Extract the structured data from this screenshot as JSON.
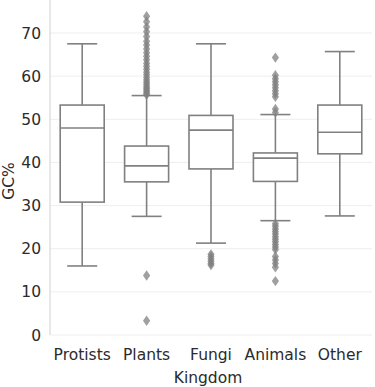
{
  "chart_data": {
    "type": "box",
    "title": "",
    "subtitle": "",
    "xlabel": "Kingdom",
    "ylabel": "GC%",
    "categories": [
      "Protists",
      "Plants",
      "Fungi",
      "Animals",
      "Other"
    ],
    "ytick_labels": [
      "0",
      "10",
      "20",
      "30",
      "40",
      "50",
      "60",
      "70"
    ],
    "yticks": [
      0,
      10,
      20,
      30,
      40,
      50,
      60,
      70
    ],
    "ylim": [
      -2.5,
      76.5
    ],
    "grid": "horizontal",
    "legend": "none",
    "box_color": "#ffffff",
    "line_color": "#808080",
    "outlier_color": "#808080",
    "grid_color": "#eeeeee",
    "text_color": "#2b2b2b",
    "boxes": [
      {
        "name": "Protists",
        "whisker_low": 16.0,
        "q1": 30.8,
        "median": 48.0,
        "q3": 53.3,
        "whisker_high": 67.5,
        "outliers": []
      },
      {
        "name": "Plants",
        "whisker_low": 27.5,
        "q1": 35.5,
        "median": 39.2,
        "q3": 43.8,
        "whisker_high": 55.5,
        "outliers": [
          73.9,
          72.6,
          71.4,
          70.3,
          69.2,
          68.1,
          67.2,
          66.3,
          65.4,
          64.6,
          63.8,
          63.0,
          62.3,
          61.6,
          60.9,
          60.3,
          59.7,
          59.1,
          58.6,
          58.1,
          57.6,
          57.2,
          56.8,
          56.4,
          56.0,
          55.7,
          13.8,
          3.3
        ]
      },
      {
        "name": "Fungi",
        "whisker_low": 21.3,
        "q1": 38.5,
        "median": 47.5,
        "q3": 50.9,
        "whisker_high": 67.5,
        "outliers": [
          18.7,
          18.2,
          17.6,
          17.1,
          16.6,
          16.2
        ]
      },
      {
        "name": "Animals",
        "whisker_low": 26.5,
        "q1": 35.6,
        "median": 41.0,
        "q3": 42.2,
        "whisker_high": 51.1,
        "outliers": [
          64.3,
          60.2,
          59.4,
          58.7,
          58.0,
          57.3,
          56.6,
          55.9,
          55.2,
          52.4,
          51.6,
          25.8,
          25.2,
          24.6,
          24.0,
          23.4,
          22.8,
          22.2,
          21.6,
          21.0,
          20.4,
          19.8,
          18.2,
          17.4,
          16.6,
          15.7,
          12.5
        ]
      },
      {
        "name": "Other",
        "whisker_low": 27.6,
        "q1": 42.0,
        "median": 47.0,
        "q3": 53.3,
        "whisker_high": 65.7,
        "outliers": []
      }
    ]
  }
}
